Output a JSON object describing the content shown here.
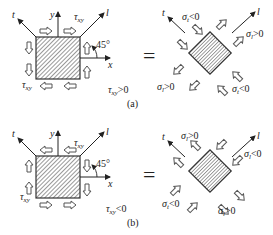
{
  "figure": {
    "panels": [
      {
        "id": "a",
        "caption": "(a)",
        "condition": {
          "sym": "τ",
          "sub": "xy",
          "rel": ">0"
        },
        "axes": {
          "x": "x",
          "y": "y",
          "t": "t",
          "l": "l",
          "angle": "45°"
        },
        "shear_label": {
          "sym": "τ",
          "sub": "xy"
        },
        "equals": "=",
        "rotated_labels": {
          "top": {
            "sym": "σ",
            "sub": "t",
            "rel": "<0"
          },
          "right": {
            "sym": "σ",
            "sub": "l",
            "rel": ">0"
          },
          "bottom_left": {
            "sym": "σ",
            "sub": "l",
            "rel": ">0"
          },
          "bottom_right": {
            "sym": "σ",
            "sub": "t",
            "rel": "<0"
          }
        },
        "rotated_axes": {
          "t": "t",
          "l": "l"
        }
      },
      {
        "id": "b",
        "caption": "(b)",
        "condition": {
          "sym": "τ",
          "sub": "xy",
          "rel": "<0"
        },
        "axes": {
          "x": "x",
          "y": "y",
          "t": "t",
          "l": "l",
          "angle": "45°"
        },
        "shear_label": {
          "sym": "τ",
          "sub": "xy"
        },
        "equals": "=",
        "rotated_labels": {
          "top": {
            "sym": "σ",
            "sub": "l",
            "rel": ">0"
          },
          "right": {
            "sym": "σ",
            "sub": "l",
            "rel": "<0"
          },
          "bottom_left": {
            "sym": "σ",
            "sub": "t",
            "rel": "<0"
          },
          "bottom_right": {
            "sym": "σ",
            "sub": "l",
            "rel": ">0"
          }
        },
        "rotated_axes": {
          "t": "t",
          "l": "l"
        }
      }
    ]
  }
}
